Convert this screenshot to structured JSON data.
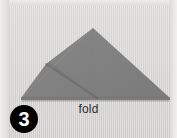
{
  "figure": {
    "kind": "origami-fold-instruction",
    "width": 177,
    "height": 138,
    "background_color": "#d7d6d4"
  },
  "step": {
    "number": "3",
    "badge_background": "#000000",
    "badge_text_color": "#ffffff"
  },
  "caption": {
    "text": "fold",
    "color": "#2b2b2b"
  },
  "paper": {
    "label": "folded-paper-triangle",
    "fill_light": "#8d8d8d",
    "fill_dark": "#787878",
    "crease_color": "#6d6d6d",
    "shadow_color": "#5e5e5e",
    "apex": {
      "x": 93,
      "y": 28
    },
    "base_left": {
      "x": 21,
      "y": 98
    },
    "base_right": {
      "x": 170,
      "y": 98
    },
    "crease_start": {
      "x": 46,
      "y": 64
    },
    "crease_end": {
      "x": 97,
      "y": 98
    }
  }
}
